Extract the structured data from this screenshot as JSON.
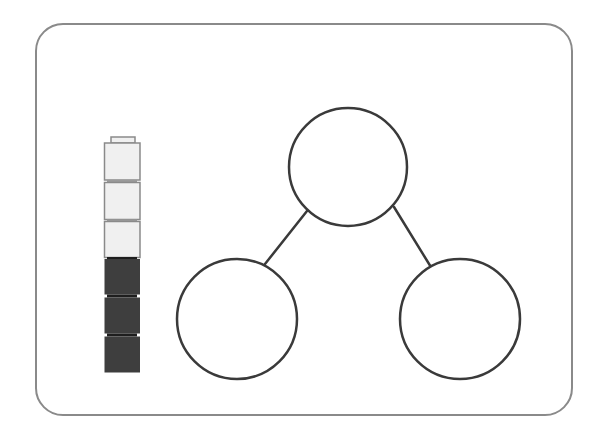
{
  "diagram": {
    "type": "number-bond",
    "frame": {
      "border_color": "#8a8a8a",
      "background": "#ffffff"
    },
    "cube_stack": {
      "total_cubes": 6,
      "cubes": [
        {
          "position": 1,
          "shade": "light",
          "fill": "#f0f0f0",
          "stroke": "#8a8a8a"
        },
        {
          "position": 2,
          "shade": "light",
          "fill": "#f0f0f0",
          "stroke": "#8a8a8a"
        },
        {
          "position": 3,
          "shade": "light",
          "fill": "#f0f0f0",
          "stroke": "#8a8a8a"
        },
        {
          "position": 4,
          "shade": "dark",
          "fill": "#3e3e3e",
          "stroke": "#3a3a3a"
        },
        {
          "position": 5,
          "shade": "dark",
          "fill": "#3e3e3e",
          "stroke": "#3a3a3a"
        },
        {
          "position": 6,
          "shade": "dark",
          "fill": "#3e3e3e",
          "stroke": "#3a3a3a"
        }
      ],
      "light_count": 3,
      "dark_count": 3
    },
    "number_bond": {
      "whole": {
        "label": "",
        "cx": 348,
        "cy": 167,
        "r": 59
      },
      "parts": [
        {
          "label": "",
          "cx": 237,
          "cy": 319,
          "r": 60
        },
        {
          "label": "",
          "cx": 460,
          "cy": 319,
          "r": 60
        }
      ],
      "stroke_color": "#3a3a3a"
    }
  }
}
